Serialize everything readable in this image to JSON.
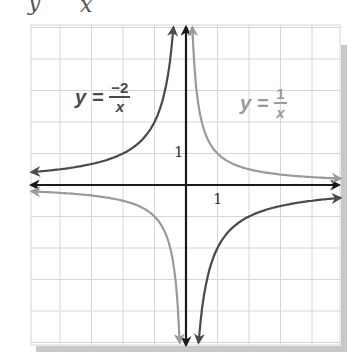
{
  "header_fragment": {
    "y_char": "y",
    "x_char": "x"
  },
  "labels": {
    "curve_neg": {
      "lhs": "y =",
      "numerator": "−2",
      "denominator": "x",
      "color": "#4a4a4a"
    },
    "curve_pos": {
      "lhs": "y =",
      "numerator": "1",
      "denominator": "x",
      "color": "#9a9a9a"
    },
    "x_tick": "1",
    "y_tick": "1"
  },
  "colors": {
    "grid": "#d6d6d6",
    "axis": "#1a1a1a",
    "curve_neg": "#4a4a4a",
    "curve_pos": "#9a9a9a",
    "shadow": "#c8c8c8"
  },
  "chart_data": {
    "type": "line",
    "title": "",
    "xlabel": "x",
    "ylabel": "y",
    "xlim": [
      -4.9,
      4.9
    ],
    "ylim": [
      -5.1,
      5.1
    ],
    "grid": true,
    "grid_step": 1,
    "tick_labels": {
      "x": [
        "1"
      ],
      "y": [
        "1"
      ]
    },
    "legend": "inline labels",
    "series": [
      {
        "name": "y = -2/x",
        "function": "-2/x",
        "color": "#4a4a4a",
        "branches": [
          {
            "x": [
              -4.9,
              -4,
              -3,
              -2,
              -1,
              -0.6,
              -0.45,
              -0.4
            ],
            "y": [
              0.41,
              0.5,
              0.67,
              1,
              2,
              3.33,
              4.44,
              5
            ]
          },
          {
            "x": [
              0.4,
              0.45,
              0.6,
              1,
              2,
              3,
              4,
              4.9
            ],
            "y": [
              -5,
              -4.44,
              -3.33,
              -2,
              -1,
              -0.67,
              -0.5,
              -0.41
            ]
          }
        ]
      },
      {
        "name": "y = 1/x",
        "function": "1/x",
        "color": "#9a9a9a",
        "branches": [
          {
            "x": [
              -4.9,
              -4,
              -3,
              -2,
              -1,
              -0.5,
              -0.3,
              -0.2
            ],
            "y": [
              -0.2,
              -0.25,
              -0.33,
              -0.5,
              -1,
              -2,
              -3.33,
              -5
            ]
          },
          {
            "x": [
              0.2,
              0.3,
              0.5,
              1,
              2,
              3,
              4,
              4.9
            ],
            "y": [
              5,
              3.33,
              2,
              1,
              0.5,
              0.33,
              0.25,
              0.2
            ]
          }
        ]
      }
    ]
  }
}
